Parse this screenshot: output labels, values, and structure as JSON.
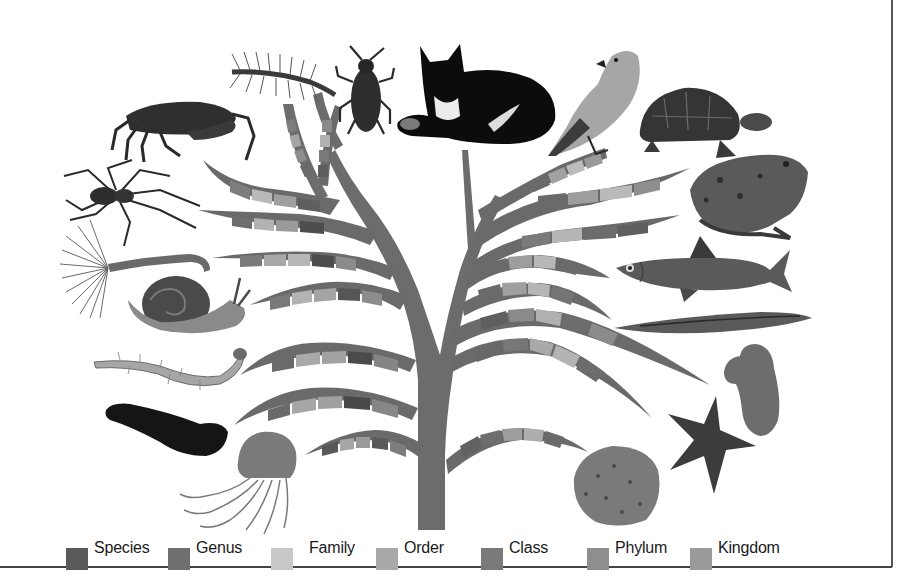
{
  "figure": {
    "type": "taxonomic classification tree illustration",
    "colors": {
      "trunk": "#6e6e6e",
      "background": "#ffffff",
      "border": "#4a4a4a"
    }
  },
  "legend": {
    "items": [
      {
        "label": "Species",
        "color": "#5a5a5a",
        "x": 66
      },
      {
        "label": "Genus",
        "color": "#6f6f6f",
        "x": 168
      },
      {
        "label": "Family",
        "color": "#c8c8c8",
        "x": 271
      },
      {
        "label": "Order",
        "color": "#a9a9a9",
        "x": 376
      },
      {
        "label": "Class",
        "color": "#7a7a7a",
        "x": 481
      },
      {
        "label": "Phylum",
        "color": "#8e8e8e",
        "x": 587
      },
      {
        "label": "Kingdom",
        "color": "#9a9a9a",
        "x": 690
      }
    ]
  },
  "organisms": {
    "left": [
      "centipede",
      "beetle",
      "crab",
      "spider",
      "fan worm",
      "snail",
      "bristle worm",
      "sea cucumber",
      "jellyfish"
    ],
    "top": [
      "cat"
    ],
    "right": [
      "bird",
      "tortoise",
      "frog",
      "fish",
      "lancelet",
      "sponge",
      "starfish",
      "coral"
    ]
  }
}
